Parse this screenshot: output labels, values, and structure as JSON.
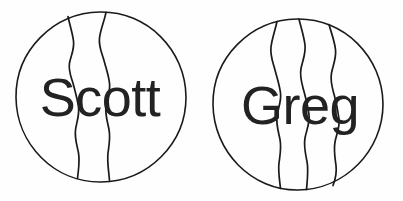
{
  "document": {
    "title": "Name Globes",
    "background_color": "#fefefe",
    "ink_color": "#1a1a1a",
    "text_color": "#222222",
    "width": 403,
    "height": 201
  },
  "figures": [
    {
      "id": "globe-scott",
      "label": "Scott",
      "icon_name": "globe-circle-icon",
      "center_x": 101,
      "center_y": 97,
      "radius": 85,
      "wave_count": 2,
      "label_x": 100,
      "label_y": 116
    },
    {
      "id": "globe-greg",
      "label": "Greg",
      "icon_name": "globe-circle-icon",
      "center_x": 298,
      "center_y": 104,
      "radius": 85,
      "wave_count": 3,
      "label_x": 300,
      "label_y": 124
    }
  ]
}
